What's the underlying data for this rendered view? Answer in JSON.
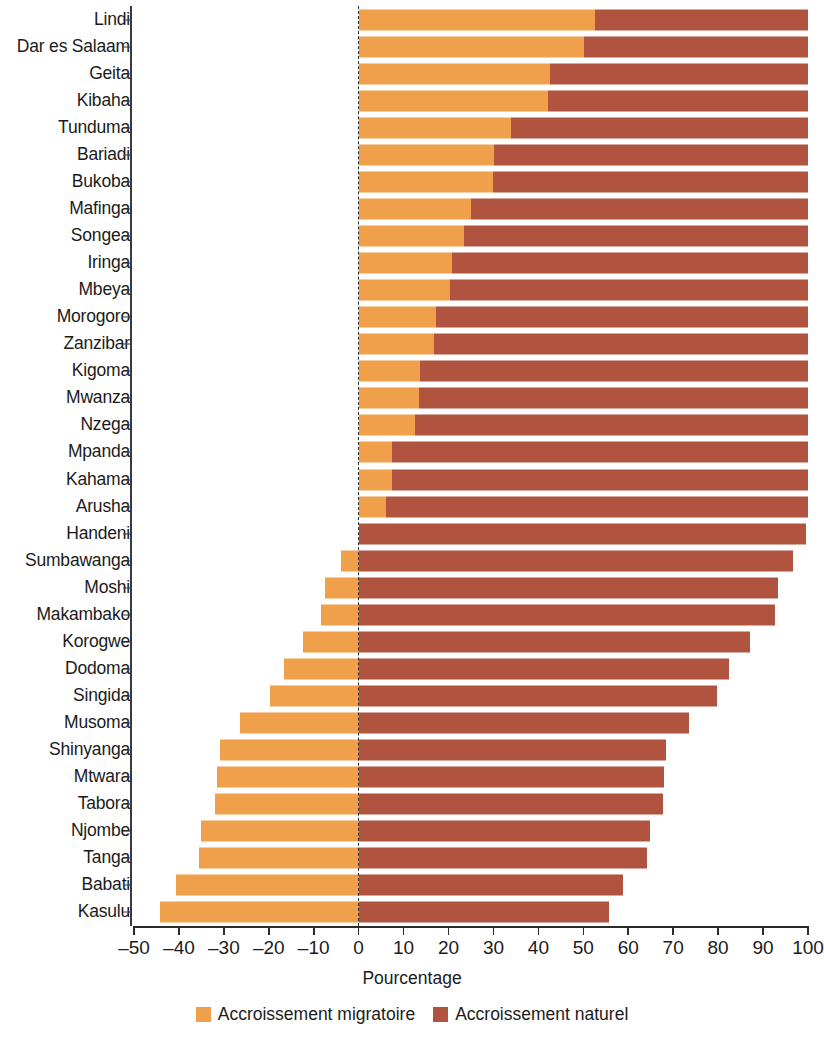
{
  "chart_data": {
    "type": "bar",
    "subtype": "diverging-stacked-horizontal",
    "title": "",
    "xlabel": "Pourcentage",
    "ylabel": "",
    "xlim": [
      -50,
      100
    ],
    "xticks": [
      -50,
      -40,
      -30,
      -20,
      -10,
      0,
      10,
      20,
      30,
      40,
      50,
      60,
      70,
      80,
      90,
      100
    ],
    "xtick_labels": [
      "–50",
      "–40",
      "–30",
      "–20",
      "–10",
      "0",
      "10",
      "20",
      "30",
      "40",
      "50",
      "60",
      "70",
      "80",
      "90",
      "100"
    ],
    "grid": false,
    "zero_reference_line": true,
    "legend_position": "bottom",
    "colors": {
      "migratoire": "#f0a04b",
      "naturel": "#b0543f",
      "axis": "#2b2b2b",
      "text": "#1b1b1b"
    },
    "categories": [
      "Lindi",
      "Dar es Salaam",
      "Geita",
      "Kibaha",
      "Tunduma",
      "Bariadi",
      "Bukoba",
      "Mafinga",
      "Songea",
      "Iringa",
      "Mbeya",
      "Morogoro",
      "Zanzibar",
      "Kigoma",
      "Mwanza",
      "Nzega",
      "Mpanda",
      "Kahama",
      "Arusha",
      "Handeni",
      "Sumbawanga",
      "Moshi",
      "Makambako",
      "Korogwe",
      "Dodoma",
      "Singida",
      "Musoma",
      "Shinyanga",
      "Mtwara",
      "Tabora",
      "Njombe",
      "Tanga",
      "Babati",
      "Kasulu"
    ],
    "series": [
      {
        "name": "Accroissement migratoire",
        "color": "#f0a04b",
        "values": [
          52.6,
          50.2,
          42.6,
          42.2,
          33.8,
          30.1,
          29.8,
          24.9,
          23.5,
          20.8,
          20.4,
          17.2,
          16.8,
          13.7,
          13.4,
          12.5,
          7.5,
          7.4,
          6.0,
          0.0,
          -4.0,
          -7.4,
          -8.4,
          -12.4,
          -16.7,
          -19.7,
          -26.3,
          -30.9,
          -31.6,
          -31.9,
          -35.2,
          -35.6,
          -40.7,
          -44.3
        ]
      },
      {
        "name": "Accroissement naturel",
        "color": "#b0543f",
        "values": [
          47.4,
          49.8,
          57.4,
          57.8,
          66.2,
          69.9,
          70.2,
          75.1,
          76.5,
          79.2,
          79.6,
          82.8,
          83.2,
          86.3,
          86.6,
          87.5,
          92.5,
          92.6,
          94.0,
          99.6,
          96.6,
          93.4,
          92.7,
          87.2,
          82.5,
          79.8,
          73.5,
          68.4,
          68.0,
          67.8,
          64.8,
          64.2,
          58.8,
          55.7
        ]
      }
    ],
    "bar_totals_right_end": [
      100,
      100,
      100,
      100,
      100,
      100,
      100,
      100,
      100,
      100,
      100,
      100,
      100,
      100,
      100,
      100,
      100,
      100,
      100,
      99.6,
      96.6,
      93.4,
      92.7,
      87.2,
      82.5,
      79.8,
      73.5,
      68.4,
      68.0,
      67.8,
      64.8,
      64.2,
      58.8,
      55.7
    ]
  },
  "legend": {
    "items": [
      {
        "label": "Accroissement migratoire",
        "color": "#f0a04b"
      },
      {
        "label": "Accroissement naturel",
        "color": "#b0543f"
      }
    ]
  },
  "axis": {
    "x_title": "Pourcentage"
  }
}
